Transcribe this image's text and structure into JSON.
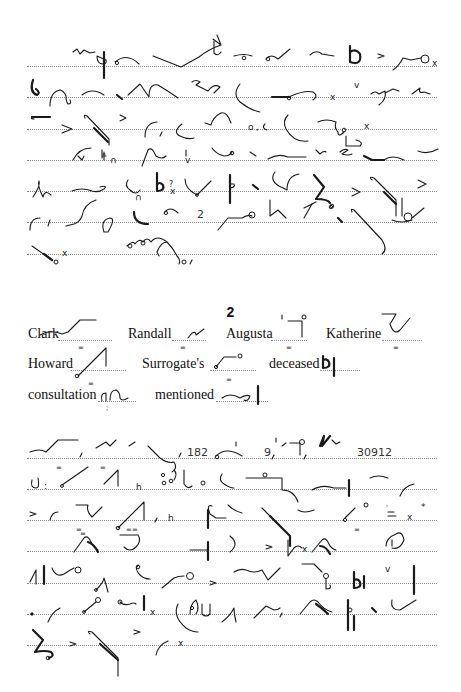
{
  "page": {
    "type": "shorthand-exercise",
    "section_number": "2"
  },
  "passage_one": {
    "lines": 7,
    "inline_numerals": [
      "2"
    ]
  },
  "key_words": [
    {
      "label": "Clark"
    },
    {
      "label": "Randall"
    },
    {
      "label": "Augusta"
    },
    {
      "label": "Katherine"
    },
    {
      "label": "Howard"
    },
    {
      "label": "Surrogate's"
    },
    {
      "label": "deceased"
    },
    {
      "label": "consultation"
    },
    {
      "label": "mentioned"
    }
  ],
  "passage_two": {
    "lines": 7,
    "inline_numerals": [
      "182",
      "9",
      "30912"
    ]
  }
}
